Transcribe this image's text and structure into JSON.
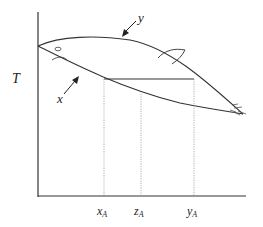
{
  "diagram": {
    "type": "binary phase diagram (fish-shaped T-x-y envelope)",
    "y_axis_label": "T",
    "curve_labels": {
      "upper": "y",
      "lower": "x"
    },
    "x_ticks": [
      {
        "main": "x",
        "sub": "A"
      },
      {
        "main": "z",
        "sub": "A"
      },
      {
        "main": "y",
        "sub": "A"
      }
    ],
    "colors": {
      "line": "#333333",
      "dotted": "#999999"
    }
  }
}
